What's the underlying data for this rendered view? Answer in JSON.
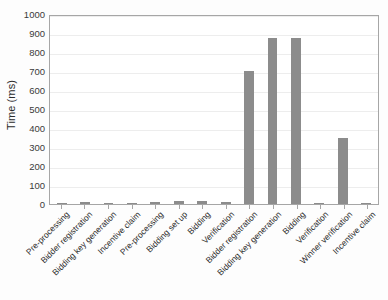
{
  "chart_data": {
    "type": "bar",
    "title": "",
    "xlabel": "",
    "ylabel": "Time (ms)",
    "ylim": [
      0,
      1000
    ],
    "grid": true,
    "legend": false,
    "bar_color": "#8c8c8c",
    "yticks": [
      0,
      100,
      200,
      300,
      400,
      500,
      600,
      700,
      800,
      900,
      1000
    ],
    "ytick_labels": [
      "0",
      "100",
      "200",
      "300",
      "400",
      "500",
      "600",
      "700",
      "800",
      "900",
      "1000"
    ],
    "categories": [
      "Pre-processing",
      "Bidder registration",
      "Bidding key generation",
      "Incentive claim",
      "Pre-processing",
      "Bidding set up",
      "Bidding",
      "Verification",
      "Bidder registration",
      "Bidding key generation",
      "Bidding",
      "Verification",
      "Winner verification",
      "Incentive claim"
    ],
    "values": [
      5,
      8,
      5,
      6,
      8,
      14,
      18,
      8,
      700,
      875,
      875,
      5,
      350,
      5
    ]
  }
}
